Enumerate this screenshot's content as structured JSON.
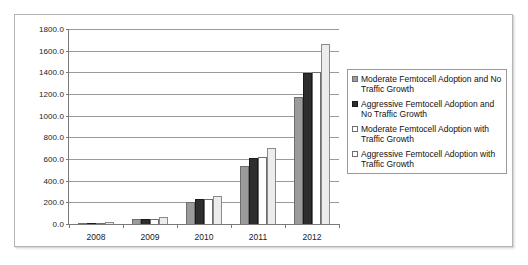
{
  "chart_data": {
    "type": "bar",
    "title": "",
    "xlabel": "",
    "ylabel": "",
    "categories": [
      "2008",
      "2009",
      "2010",
      "2011",
      "2012"
    ],
    "ylim": [
      0,
      1800
    ],
    "ytick_step": 200,
    "ytick_labels": [
      "1800.0",
      "1600.0",
      "1400.0",
      "1200.0",
      "1000.0",
      "800.0",
      "600.0",
      "400.0",
      "200.0",
      "0.0"
    ],
    "ytick_values": [
      1800,
      1600,
      1400,
      1200,
      1000,
      800,
      600,
      400,
      200,
      0
    ],
    "grid": true,
    "legend_position": "right",
    "series": [
      {
        "name": "Moderate Femtocell Adoption and No Traffic Growth",
        "color": "#9b9b9b",
        "values": [
          12,
          48,
          205,
          540,
          1175
        ]
      },
      {
        "name": "Aggressive Femtocell Adoption and No Traffic Growth",
        "color": "#2e2e2e",
        "values": [
          13,
          50,
          235,
          610,
          1390
        ]
      },
      {
        "name": "Moderate Femtocell Adoption with Traffic Growth",
        "color": "#ffffff",
        "values": [
          12,
          50,
          228,
          615,
          1405
        ]
      },
      {
        "name": "Aggressive Femtocell Adoption with Traffic Growth",
        "color": "#ececec",
        "values": [
          14,
          62,
          255,
          700,
          1660
        ]
      }
    ]
  },
  "legend": {
    "items": [
      {
        "label": "Moderate Femtocell Adoption and No Traffic Growth"
      },
      {
        "label": "Aggressive Femtocell Adoption and No Traffic Growth"
      },
      {
        "label": "Moderate Femtocell Adoption with Traffic Growth"
      },
      {
        "label": "Aggressive Femtocell Adoption with Traffic Growth"
      }
    ]
  }
}
